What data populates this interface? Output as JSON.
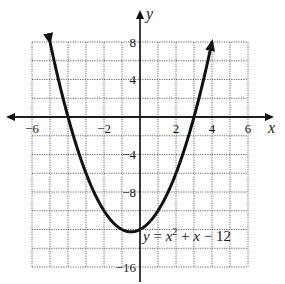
{
  "chart_data": {
    "type": "line",
    "title": "",
    "xlabel": "x",
    "ylabel": "y",
    "xlim": [
      -6,
      6
    ],
    "ylim": [
      -16,
      8
    ],
    "grid": true,
    "grid_x_step": 1,
    "grid_y_step": 2,
    "x_ticks": [
      -6,
      -2,
      2,
      4,
      6
    ],
    "y_ticks": [
      8,
      4,
      -4,
      -8,
      -16
    ],
    "x_tick_labels": [
      "−6",
      "−2",
      "2",
      "4",
      "6"
    ],
    "y_tick_labels": [
      "8",
      "4",
      "−4",
      "−8",
      "−16"
    ],
    "series": [
      {
        "name": "y = x² + x − 12",
        "function": "x^2 + x - 12",
        "x": [
          -5,
          -4,
          -3,
          -2,
          -1,
          -0.5,
          0,
          1,
          2,
          3,
          4
        ],
        "y": [
          8,
          0,
          -6,
          -10,
          -12,
          -12.25,
          -12,
          -10,
          -6,
          0,
          8
        ],
        "arrows_at_ends": true
      }
    ],
    "annotations": [
      {
        "text_parts": [
          "y",
          " = ",
          "x",
          "2",
          " + ",
          "x",
          " − 12"
        ],
        "x": 0.2,
        "y": -13.5
      }
    ]
  },
  "labels": {
    "x_axis": "x",
    "y_axis": "y",
    "equation": {
      "y": "y",
      "eq": " = ",
      "x": "x",
      "exp": "2",
      "plus": " + ",
      "x2": "x",
      "rest": " − 12"
    },
    "ticks": {
      "x_m6": "−6",
      "x_m2": "−2",
      "x_2": "2",
      "x_4": "4",
      "x_6": "6",
      "y_8": "8",
      "y_4": "4",
      "y_m4": "−4",
      "y_m8": "−8",
      "y_m16": "−16"
    }
  },
  "colors": {
    "curve": "#111111",
    "axis": "#111111",
    "grid": "#555555"
  }
}
